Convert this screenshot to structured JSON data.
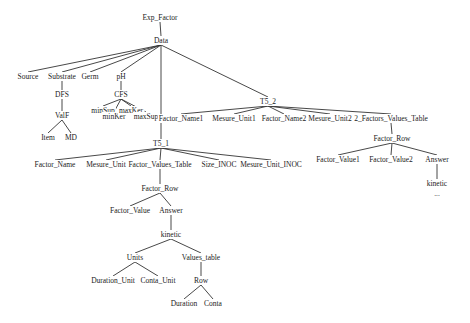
{
  "diagram": {
    "type": "tree",
    "root": "Exp_Factor",
    "colors": {
      "background": "#ffffff",
      "line": "#333333",
      "text": "#222222"
    },
    "nodes": [
      {
        "id": "exp_factor",
        "label": "Exp_Factor",
        "x": 160,
        "y": 20
      },
      {
        "id": "data",
        "label": "Data",
        "x": 161,
        "y": 43
      },
      {
        "id": "source",
        "label": "Source",
        "x": 28,
        "y": 79
      },
      {
        "id": "substrate",
        "label": "Substrate",
        "x": 62,
        "y": 79
      },
      {
        "id": "germ",
        "label": "Germ",
        "x": 90,
        "y": 79
      },
      {
        "id": "ph",
        "label": "pH",
        "x": 121,
        "y": 79
      },
      {
        "id": "dfs",
        "label": "DFS",
        "x": 62,
        "y": 97
      },
      {
        "id": "valf",
        "label": "ValF",
        "x": 62,
        "y": 118
      },
      {
        "id": "item",
        "label": "Item",
        "x": 48,
        "y": 140
      },
      {
        "id": "md",
        "label": "MD",
        "x": 71,
        "y": 140
      },
      {
        "id": "cfs",
        "label": "CFS",
        "x": 121,
        "y": 97
      },
      {
        "id": "minsup",
        "label": "minSup",
        "x": 103,
        "y": 113
      },
      {
        "id": "minker",
        "label": "minKer",
        "x": 114,
        "y": 119
      },
      {
        "id": "maxker",
        "label": "maxKer",
        "x": 131,
        "y": 113
      },
      {
        "id": "maxsup",
        "label": "maxSup",
        "x": 146,
        "y": 119
      },
      {
        "id": "t5_2",
        "label": "T5_2",
        "x": 268,
        "y": 104
      },
      {
        "id": "factor_name1",
        "label": "Factor_Name1",
        "x": 181,
        "y": 121
      },
      {
        "id": "mesure_unit1",
        "label": "Mesure_Unit1",
        "x": 234,
        "y": 121
      },
      {
        "id": "factor_name2",
        "label": "Factor_Name2",
        "x": 284,
        "y": 121
      },
      {
        "id": "mesure_unit2",
        "label": "Mesure_Unit2",
        "x": 330,
        "y": 121
      },
      {
        "id": "two_factors_values_table",
        "label": "2_Factors_Values_Table",
        "x": 391,
        "y": 121
      },
      {
        "id": "factor_row_2",
        "label": "Factor_Row",
        "x": 392,
        "y": 141
      },
      {
        "id": "factor_value1",
        "label": "Factor_Value1",
        "x": 338,
        "y": 162
      },
      {
        "id": "factor_value2",
        "label": "Factor_Value2",
        "x": 391,
        "y": 162
      },
      {
        "id": "answer_2",
        "label": "Answer",
        "x": 437,
        "y": 162
      },
      {
        "id": "kinetic_2",
        "label": "kinetic",
        "x": 437,
        "y": 186
      },
      {
        "id": "ellipsis_2",
        "label": "...",
        "x": 437,
        "y": 196
      },
      {
        "id": "t5_1",
        "label": "T5_1",
        "x": 161,
        "y": 146
      },
      {
        "id": "factor_name",
        "label": "Factor_Name",
        "x": 55,
        "y": 167
      },
      {
        "id": "mesure_unit",
        "label": "Mesure_Unit",
        "x": 106,
        "y": 167
      },
      {
        "id": "factor_values_table",
        "label": "Factor_Values_Table",
        "x": 160,
        "y": 167
      },
      {
        "id": "size_inoc",
        "label": "Size_INOC",
        "x": 219,
        "y": 167
      },
      {
        "id": "mesure_unit_inoc",
        "label": "Mesure_Unit_INOC",
        "x": 271,
        "y": 167
      },
      {
        "id": "factor_row_1",
        "label": "Factor_Row",
        "x": 160,
        "y": 191
      },
      {
        "id": "factor_value",
        "label": "Factor_Value",
        "x": 130,
        "y": 213
      },
      {
        "id": "answer_1",
        "label": "Answer",
        "x": 171,
        "y": 213
      },
      {
        "id": "kinetic_1",
        "label": "kinetic",
        "x": 171,
        "y": 237
      },
      {
        "id": "units",
        "label": "Units",
        "x": 135,
        "y": 260
      },
      {
        "id": "values_table",
        "label": "Values_table",
        "x": 201,
        "y": 260
      },
      {
        "id": "duration_unit",
        "label": "Duration_Unit",
        "x": 113,
        "y": 283
      },
      {
        "id": "conta_unit",
        "label": "Conta_Unit",
        "x": 158,
        "y": 283
      },
      {
        "id": "row",
        "label": "Row",
        "x": 201,
        "y": 283
      },
      {
        "id": "duration",
        "label": "Duration",
        "x": 184,
        "y": 306
      },
      {
        "id": "conta",
        "label": "Conta",
        "x": 213,
        "y": 306
      }
    ],
    "edges": [
      [
        "exp_factor",
        "data"
      ],
      [
        "data",
        "source"
      ],
      [
        "data",
        "substrate"
      ],
      [
        "data",
        "germ"
      ],
      [
        "data",
        "ph"
      ],
      [
        "data",
        "t5_1"
      ],
      [
        "data",
        "t5_2"
      ],
      [
        "substrate",
        "dfs"
      ],
      [
        "dfs",
        "valf"
      ],
      [
        "valf",
        "item"
      ],
      [
        "valf",
        "md"
      ],
      [
        "ph",
        "cfs"
      ],
      [
        "cfs",
        "minsup"
      ],
      [
        "cfs",
        "minker"
      ],
      [
        "cfs",
        "maxker"
      ],
      [
        "cfs",
        "maxsup"
      ],
      [
        "t5_2",
        "factor_name1"
      ],
      [
        "t5_2",
        "mesure_unit1"
      ],
      [
        "t5_2",
        "factor_name2"
      ],
      [
        "t5_2",
        "mesure_unit2"
      ],
      [
        "t5_2",
        "two_factors_values_table"
      ],
      [
        "two_factors_values_table",
        "factor_row_2"
      ],
      [
        "factor_row_2",
        "factor_value1"
      ],
      [
        "factor_row_2",
        "factor_value2"
      ],
      [
        "factor_row_2",
        "answer_2"
      ],
      [
        "answer_2",
        "kinetic_2"
      ],
      [
        "t5_1",
        "factor_name"
      ],
      [
        "t5_1",
        "mesure_unit"
      ],
      [
        "t5_1",
        "factor_values_table"
      ],
      [
        "t5_1",
        "size_inoc"
      ],
      [
        "t5_1",
        "mesure_unit_inoc"
      ],
      [
        "factor_values_table",
        "factor_row_1"
      ],
      [
        "factor_row_1",
        "factor_value"
      ],
      [
        "factor_row_1",
        "answer_1"
      ],
      [
        "answer_1",
        "kinetic_1"
      ],
      [
        "kinetic_1",
        "units"
      ],
      [
        "kinetic_1",
        "values_table"
      ],
      [
        "units",
        "duration_unit"
      ],
      [
        "units",
        "conta_unit"
      ],
      [
        "values_table",
        "row"
      ],
      [
        "row",
        "duration"
      ],
      [
        "row",
        "conta"
      ]
    ]
  }
}
